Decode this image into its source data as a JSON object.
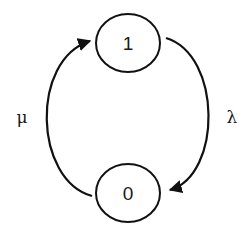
{
  "diagram": {
    "type": "state-transition",
    "nodes": [
      {
        "id": "state-1",
        "label": "1"
      },
      {
        "id": "state-0",
        "label": "0"
      }
    ],
    "edges": [
      {
        "from": "1",
        "to": "0",
        "label": "λ",
        "side": "right"
      },
      {
        "from": "0",
        "to": "1",
        "label": "μ",
        "side": "left"
      }
    ],
    "colors": {
      "stroke": "#111111",
      "background": "#ffffff"
    }
  }
}
